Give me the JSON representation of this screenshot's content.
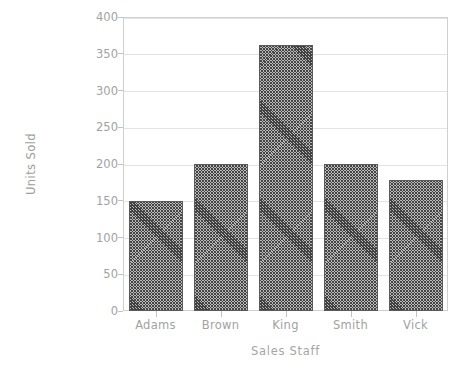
{
  "chart_data": {
    "type": "bar",
    "title": "",
    "xlabel": "Sales Staff",
    "ylabel": "Units Sold",
    "categories": [
      "Adams",
      "Brown",
      "King",
      "Smith",
      "Vick"
    ],
    "values": [
      150,
      200,
      362,
      200,
      178
    ],
    "ylim": [
      0,
      400
    ],
    "yticks": [
      0,
      50,
      100,
      150,
      200,
      250,
      300,
      350,
      400
    ],
    "ytick_labels": [
      "0",
      "50",
      "100",
      "150",
      "200",
      "250",
      "300",
      "350",
      "400"
    ],
    "grid": true,
    "legend": "none",
    "bar_fill": "diagonal-crosshatch",
    "colors": {
      "background": "#ffffff",
      "plot_border": "#d0d0d0",
      "gridline": "#e3e3e3",
      "bar_hatch": "#3f3f3f",
      "bar_base": "#b9b9b9",
      "text": "#a2a2a2"
    }
  }
}
